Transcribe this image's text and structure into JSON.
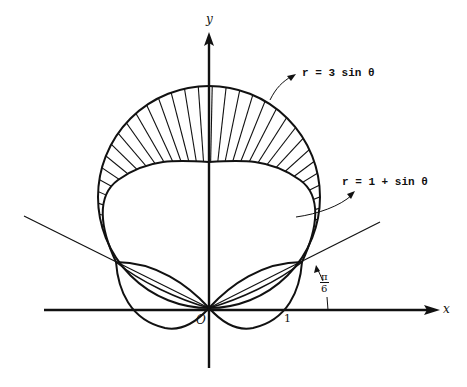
{
  "figure": {
    "axes": {
      "x_label": "x",
      "y_label": "y",
      "origin_label": "O",
      "x_tick_label": "1"
    },
    "curves": [
      {
        "name": "outer-circle",
        "equation": "r = 3 sin θ"
      },
      {
        "name": "inner-curve",
        "equation": "r = 1 + sin θ"
      }
    ],
    "angle_label": {
      "numerator": "π",
      "denominator": "6"
    },
    "shaded_region": "region inside r = 3 sin θ and outside r = 1 + sin θ",
    "colors": {
      "ink": "#111111",
      "background": "#ffffff"
    }
  }
}
